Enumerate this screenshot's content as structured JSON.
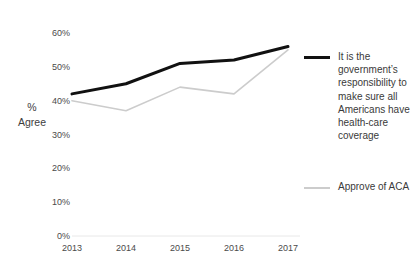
{
  "chart_data": {
    "type": "line",
    "title": "",
    "xlabel": "",
    "ylabel": "% Agree",
    "categories": [
      "2013",
      "2014",
      "2015",
      "2016",
      "2017"
    ],
    "ylim": [
      0,
      60
    ],
    "yticks": [
      0,
      10,
      20,
      30,
      40,
      50,
      60
    ],
    "ytick_labels": [
      "0%",
      "10%",
      "20%",
      "30%",
      "40%",
      "50%",
      "60%"
    ],
    "grid": false,
    "legend_position": "right",
    "series": [
      {
        "name": "It is the government’s responsibility to make sure all Americans have health-care coverage",
        "color": "#111111",
        "width": 3,
        "values": [
          42,
          45,
          51,
          52,
          56
        ]
      },
      {
        "name": "Approve of ACA",
        "color": "#cccccc",
        "width": 1.6,
        "values": [
          40,
          37,
          44,
          42,
          55
        ]
      }
    ]
  },
  "axis": {
    "y_label_line1": "%",
    "y_label_line2": "Agree"
  },
  "legend": {
    "items": [
      {
        "label": "It is the government’s responsibility to make sure all Americans have health-care coverage",
        "color": "#111111"
      },
      {
        "label": "Approve of ACA",
        "color": "#cccccc"
      }
    ]
  },
  "colors": {
    "series1": "#111111",
    "series2": "#cccccc",
    "axis_line": "#e8e8e8",
    "tick_text": "#4a4a4a"
  }
}
